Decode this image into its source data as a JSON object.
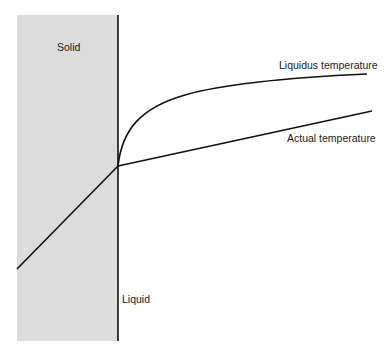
{
  "diagram": {
    "regions": {
      "solid": "Solid",
      "liquid": "Liquid"
    },
    "curves": {
      "liquidus": "Liquidus temperature",
      "actual": "Actual temperature"
    },
    "colors": {
      "solid_fill": "#dcdcdc",
      "line": "#111111",
      "background": "#ffffff"
    }
  }
}
